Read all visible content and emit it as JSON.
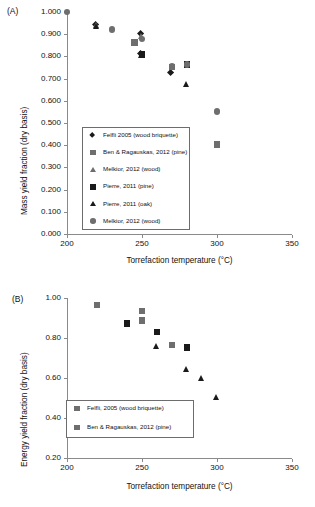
{
  "figure": {
    "panels": [
      {
        "tag": "(A)",
        "xlabel": "Torrefaction temperature (°C)",
        "ylabel": "Mass yield fraction (dry basis)"
      },
      {
        "tag": "(B)",
        "xlabel": "Torrefaction temperature (°C)",
        "ylabel": "Energy yield fraction (dry basis)"
      }
    ]
  },
  "chart_data": [
    {
      "type": "scatter",
      "panel": "(A)",
      "title": "",
      "xlabel": "Torrefaction temperature (°C)",
      "ylabel": "Mass yield fraction (dry basis)",
      "xlim": [
        200,
        350
      ],
      "ylim": [
        0.0,
        1.0
      ],
      "xticks": [
        200,
        250,
        300,
        350
      ],
      "yticks": [
        "0.000",
        "0.100",
        "0.200",
        "0.300",
        "0.400",
        "0.500",
        "0.600",
        "0.700",
        "0.800",
        "0.900",
        "1.000"
      ],
      "grid": false,
      "legend_position": "lower-left-inside",
      "series": [
        {
          "name": "Felfli 2005 (wood briquette)",
          "marker": "diamond",
          "color": "#1a1a1a",
          "points": [
            [
              220,
              0.938
            ],
            [
              250,
              0.897
            ],
            [
              250,
              0.806
            ],
            [
              270,
              0.721
            ]
          ]
        },
        {
          "name": "Ben & Ragauskas, 2012 (pine)",
          "marker": "square",
          "color": "#6e6e6e",
          "points": [
            [
              245,
              0.862
            ],
            [
              270,
              0.752
            ],
            [
              300,
              0.402
            ]
          ]
        },
        {
          "name": "Melkior, 2012 (wood)",
          "marker": "triangle",
          "color": "#6e6e6e",
          "points": [
            [
              220,
              0.942
            ],
            [
              250,
              0.889
            ]
          ]
        },
        {
          "name": "Pierre, 2011 (pine)",
          "marker": "square",
          "color": "#1a1a1a",
          "points": [
            [
              250,
              0.808
            ],
            [
              280,
              0.764
            ]
          ]
        },
        {
          "name": "Pierre, 2011 (oak)",
          "marker": "triangle",
          "color": "#1a1a1a",
          "points": [
            [
              220,
              0.936
            ],
            [
              250,
              0.806
            ],
            [
              280,
              0.672
            ]
          ]
        },
        {
          "name": "Melkior, 2012 (wood)",
          "marker": "circle",
          "color": "#6e6e6e",
          "points": [
            [
              200,
              0.999
            ],
            [
              230,
              0.921
            ],
            [
              250,
              0.878
            ],
            [
              270,
              0.757
            ],
            [
              280,
              0.763
            ],
            [
              300,
              0.552
            ]
          ]
        }
      ],
      "legend": [
        {
          "label": "Felfli 2005 (wood briquette)",
          "marker": "diamond",
          "color": "#1a1a1a"
        },
        {
          "label": "Ben & Ragauskas, 2012 (pine)",
          "marker": "square",
          "color": "#6e6e6e"
        },
        {
          "label": "Melkior, 2012 (wood)",
          "marker": "triangle",
          "color": "#6e6e6e"
        },
        {
          "label": "Pierre, 2011 (pine)",
          "marker": "square",
          "color": "#1a1a1a"
        },
        {
          "label": "Pierre, 2011 (oak)",
          "marker": "triangle",
          "color": "#1a1a1a"
        },
        {
          "label": "Melkior, 2012 (wood)",
          "marker": "circle",
          "color": "#6e6e6e"
        }
      ]
    },
    {
      "type": "scatter",
      "panel": "(B)",
      "title": "",
      "xlabel": "Torrefaction temperature (°C)",
      "ylabel": "Energy yield fraction (dry basis)",
      "xlim": [
        200,
        350
      ],
      "ylim": [
        0.2,
        1.0
      ],
      "xticks": [
        200,
        250,
        300,
        350
      ],
      "yticks": [
        "0.20",
        "0.40",
        "0.60",
        "0.80",
        "1.00"
      ],
      "grid": false,
      "legend_position": "lower-left-inside",
      "series": [
        {
          "name": "Felfli, 2005 (wood briquette)",
          "marker": "square",
          "color": "#6e6e6e",
          "points": [
            [
              220,
              0.965
            ],
            [
              240,
              0.873
            ],
            [
              250,
              0.935
            ],
            [
              250,
              0.888
            ],
            [
              270,
              0.765
            ]
          ]
        },
        {
          "name": "Ben & Ragauskas, 2012 (pine)",
          "marker": "square",
          "color": "#1a1a1a",
          "points": [
            [
              240,
              0.872
            ],
            [
              260,
              0.83
            ],
            [
              280,
              0.752
            ]
          ]
        },
        {
          "name": "unlabeled-triangles",
          "marker": "triangle",
          "color": "#1a1a1a",
          "points": [
            [
              260,
              0.76
            ],
            [
              280,
              0.645
            ],
            [
              290,
              0.598
            ],
            [
              300,
              0.505
            ]
          ]
        }
      ],
      "legend": [
        {
          "label": "Felfli, 2005 (wood briquette)",
          "marker": "square",
          "color": "#6e6e6e"
        },
        {
          "label": "Ben & Ragauskas, 2012 (pine)",
          "marker": "square",
          "color": "#6e6e6e"
        }
      ]
    }
  ]
}
